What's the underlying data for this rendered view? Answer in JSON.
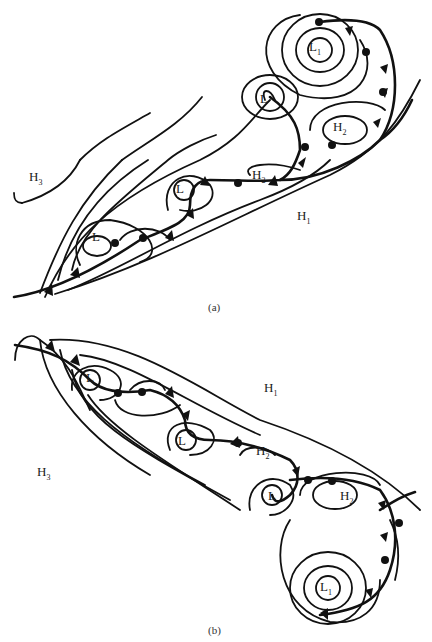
{
  "figure": {
    "panels": [
      {
        "id": "a",
        "caption": "(a)",
        "labels": {
          "H1": {
            "base": "H",
            "sub": "1"
          },
          "H2_upper": {
            "base": "H",
            "sub": "2"
          },
          "H2_mid": {
            "base": "H",
            "sub": "2"
          },
          "H3": {
            "base": "H",
            "sub": "3"
          },
          "L_deep": {
            "base": "L",
            "sub": "1"
          },
          "L_mid_upper": {
            "base": "L",
            "sub": ""
          },
          "L_mid": {
            "base": "L",
            "sub": ""
          },
          "L_lower": {
            "base": "L",
            "sub": ""
          }
        }
      },
      {
        "id": "b",
        "caption": "(b)",
        "labels": {
          "H1": {
            "base": "H",
            "sub": "1"
          },
          "H2_mid": {
            "base": "H",
            "sub": "2"
          },
          "H2_lower": {
            "base": "H",
            "sub": "2"
          },
          "H3": {
            "base": "H",
            "sub": "3"
          },
          "L_deep": {
            "base": "L",
            "sub": "1"
          },
          "L_upper": {
            "base": "L",
            "sub": ""
          },
          "L_mid": {
            "base": "L",
            "sub": ""
          },
          "L_lower": {
            "base": "L",
            "sub": ""
          }
        }
      }
    ]
  }
}
